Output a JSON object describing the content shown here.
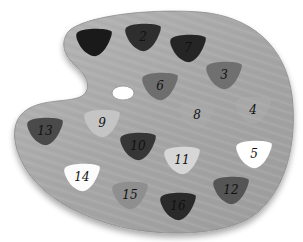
{
  "figure": {
    "background_color": "#ffffff",
    "palette_wood_color": "#a9a9a9",
    "palette_edge_color": "#8a8a8a",
    "thumb_hole_color": "#ffffff"
  },
  "blobs": [
    {
      "label": "",
      "id": "1",
      "cx": 94,
      "cy": 42,
      "color": "#1a1a1a"
    },
    {
      "label": "2",
      "id": "2",
      "cx": 143,
      "cy": 37,
      "color": "#2e2e2e"
    },
    {
      "label": "7",
      "id": "7",
      "cx": 188,
      "cy": 48,
      "color": "#252525"
    },
    {
      "label": "3",
      "id": "3",
      "cx": 224,
      "cy": 75,
      "color": "#707070"
    },
    {
      "label": "6",
      "id": "6",
      "cx": 160,
      "cy": 86,
      "color": "#6e6e6e"
    },
    {
      "label": "8",
      "id": "8",
      "cx": 197,
      "cy": 115,
      "color": "#b0b0b0"
    },
    {
      "label": "4",
      "id": "4",
      "cx": 253,
      "cy": 110,
      "color": "#b3b3b3"
    },
    {
      "label": "9",
      "id": "9",
      "cx": 102,
      "cy": 123,
      "color": "#c4c4c4"
    },
    {
      "label": "13",
      "id": "13",
      "cx": 45,
      "cy": 131,
      "color": "#4a4a4a"
    },
    {
      "label": "10",
      "id": "10",
      "cx": 138,
      "cy": 146,
      "color": "#363636"
    },
    {
      "label": "11",
      "id": "11",
      "cx": 182,
      "cy": 160,
      "color": "#d6d6d6"
    },
    {
      "label": "5",
      "id": "5",
      "cx": 254,
      "cy": 154,
      "color": "#ffffff"
    },
    {
      "label": "14",
      "id": "14",
      "cx": 82,
      "cy": 177,
      "color": "#fcfcfc"
    },
    {
      "label": "15",
      "id": "15",
      "cx": 130,
      "cy": 195,
      "color": "#8f8f8f"
    },
    {
      "label": "16",
      "id": "16",
      "cx": 178,
      "cy": 206,
      "color": "#2a2a2a"
    },
    {
      "label": "12",
      "id": "12",
      "cx": 231,
      "cy": 190,
      "color": "#555555"
    }
  ]
}
